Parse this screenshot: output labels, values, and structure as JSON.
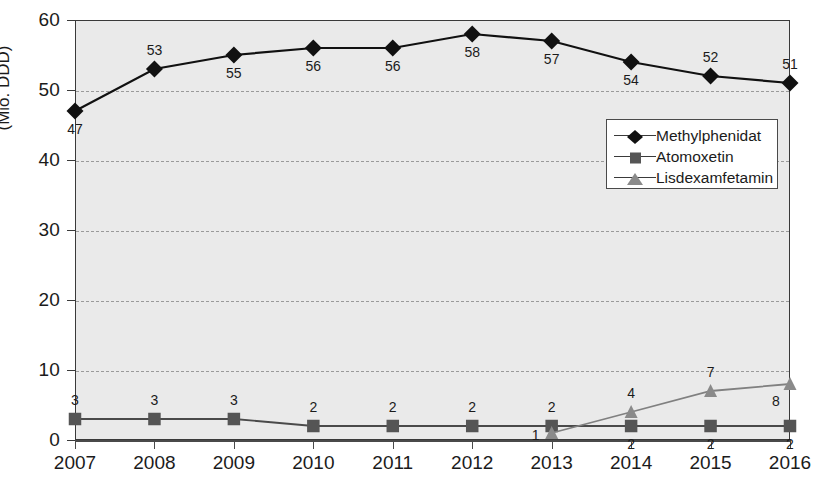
{
  "chart_data": {
    "type": "line",
    "title": "",
    "subtitle": "",
    "xlabel": "",
    "ylabel": "(Mio. DDD)",
    "categories": [
      "2007",
      "2008",
      "2009",
      "2010",
      "2011",
      "2012",
      "2013",
      "2014",
      "2015",
      "2016"
    ],
    "ylim": [
      0,
      60
    ],
    "xlim": [
      "2007",
      "2016"
    ],
    "y_ticks": [
      "0",
      "10",
      "20",
      "30",
      "40",
      "50",
      "60"
    ],
    "grid": "horizontal-dashed",
    "legend_position": "upper-right-inside",
    "series": [
      {
        "name": "Methylphenidat",
        "marker": "diamond",
        "color": "#111111",
        "values": [
          47,
          53,
          55,
          56,
          56,
          58,
          57,
          54,
          52,
          51
        ],
        "labels": [
          "47",
          "53",
          "55",
          "56",
          "56",
          "58",
          "57",
          "54",
          "52",
          "51"
        ],
        "label_positions": [
          "below",
          "above",
          "below",
          "below",
          "below",
          "below",
          "below",
          "below",
          "above",
          "above"
        ]
      },
      {
        "name": "Atomoxetin",
        "marker": "square",
        "color": "#555555",
        "values": [
          3,
          3,
          3,
          2,
          2,
          2,
          2,
          2,
          2,
          2
        ],
        "labels": [
          "3",
          "3",
          "3",
          "2",
          "2",
          "2",
          "2",
          "2",
          "2",
          "2"
        ],
        "label_positions": [
          "above",
          "above",
          "above",
          "above",
          "above",
          "above",
          "above",
          "below",
          "below",
          "below"
        ]
      },
      {
        "name": "Lisdexamfetamin",
        "marker": "triangle",
        "color": "#8a8a8a",
        "values": [
          null,
          null,
          null,
          null,
          null,
          null,
          1,
          4,
          7,
          8
        ],
        "labels": [
          "",
          "",
          "",
          "",
          "",
          "",
          "1",
          "4",
          "7",
          "8"
        ],
        "label_positions": [
          "",
          "",
          "",
          "",
          "",
          "",
          "left",
          "above",
          "above",
          "below-left"
        ]
      }
    ]
  },
  "colors": {
    "plot_background": "#eaeaea",
    "page_background": "#ffffff",
    "axis": "#3a3a3a",
    "grid": "#9a9a9a",
    "series_1": "#111111",
    "series_2": "#555555",
    "series_3": "#8a8a8a"
  }
}
